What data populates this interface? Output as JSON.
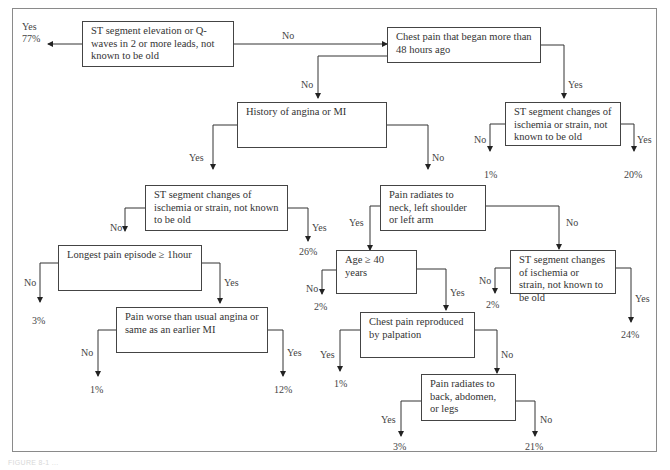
{
  "diagram": {
    "type": "decision-tree",
    "nodes": {
      "st_elevation": "ST segment elevation or Q-waves in 2 or more leads, not known to be old",
      "chest_pain_48h": "Chest pain that began more than 48 hours ago",
      "history_angina": "History of angina or MI",
      "st_changes_right": "ST segment changes of ischemia or strain, not known to be old",
      "st_changes_left": "ST segment changes of ischemia or strain, not known to be old",
      "pain_radiates_neck": "Pain radiates to neck, left shoulder or left arm",
      "longest_pain": "Longest pain episode ≥ 1hour",
      "age_40": "Age ≥ 40 years",
      "st_changes_mid": "ST segment changes of ischemia or strain, not known to be old",
      "pain_worse": "Pain worse than usual angina or same as an earlier MI",
      "chest_pain_palpation": "Chest pain reproduced by palpation",
      "pain_radiates_back": "Pain radiates to back, abdomen, or legs"
    },
    "edge_labels": {
      "yes": "Yes",
      "no": "No"
    },
    "outcomes": {
      "st_elevation_yes": "77%",
      "st_right_no": "1%",
      "st_right_yes": "20%",
      "st_left_yes": "26%",
      "longest_no": "3%",
      "worse_no": "1%",
      "worse_yes": "12%",
      "age_no": "2%",
      "mid_no": "2%",
      "mid_yes": "24%",
      "palpation_yes": "1%",
      "back_yes": "3%",
      "back_no": "21%"
    }
  },
  "caption": "FIGURE 8-1 ..."
}
